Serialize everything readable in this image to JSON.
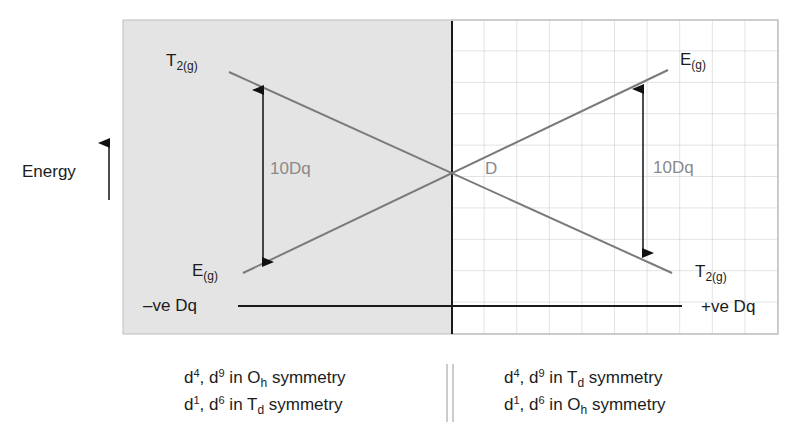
{
  "diagram": {
    "axis_label": "Energy",
    "left_region": {
      "fill": "#e4e4e4",
      "description": "negative Dq side"
    },
    "right_region": {
      "fill": "#ffffff",
      "grid_color": "#c8c8c8",
      "description": "positive Dq side"
    },
    "line_color": "#7a7a7a",
    "arrow_color": "#111111",
    "labels": {
      "t2g_left": {
        "main": "T",
        "sub": "2(g)"
      },
      "eg_left": {
        "main": "E",
        "sub": "(g)"
      },
      "eg_right": {
        "main": "E",
        "sub": "(g)"
      },
      "t2g_right": {
        "main": "T",
        "sub": "2(g)"
      },
      "split_left": "10Dq",
      "split_right": "10Dq",
      "crossing_point": "D",
      "neg_dq": "–ve Dq",
      "pos_dq": "+ve Dq"
    },
    "captions": {
      "left": [
        {
          "a": "d",
          "a_sup": "4",
          "b": ", d",
          "b_sup": "9",
          "c": " in O",
          "c_sub": "h",
          "d": " symmetry"
        },
        {
          "a": "d",
          "a_sup": "1",
          "b": ", d",
          "b_sup": "6",
          "c": " in T",
          "c_sub": "d",
          "d": " symmetry"
        }
      ],
      "right": [
        {
          "a": "d",
          "a_sup": "4",
          "b": ", d",
          "b_sup": "9",
          "c": " in T",
          "c_sub": "d",
          "d": " symmetry"
        },
        {
          "a": "d",
          "a_sup": "1",
          "b": ", d",
          "b_sup": "6",
          "c": " in O",
          "c_sub": "h",
          "d": " symmetry"
        }
      ]
    }
  }
}
